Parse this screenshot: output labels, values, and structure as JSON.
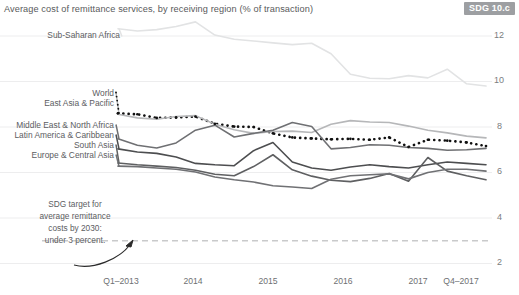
{
  "header": {
    "subtitle": "Average cost of remittance services, by receiving region (% of transaction)",
    "badge": "SDG 10.c"
  },
  "annotation": {
    "line1": "SDG target for",
    "line2": "average remittance",
    "line3": "costs by 2030:",
    "line4": "under 3 percent."
  },
  "series_labels": {
    "sub_saharan_africa": "Sub-Saharan Africa",
    "world": "World",
    "east_asia_pacific": "East Asia & Pacific",
    "middle_east_north_africa": "Middle East & North Africa",
    "latin_america_caribbean": "Latin America & Caribbean",
    "south_asia": "South Asia",
    "europe_central_asia": "Europe & Central Asia"
  },
  "axes": {
    "yticks": [
      "12",
      "10",
      "8",
      "6",
      "4",
      "2"
    ],
    "xticks": [
      "Q1–2013",
      "2014",
      "2015",
      "2016",
      "2017",
      "Q4–2017"
    ]
  },
  "chart_data": {
    "type": "line",
    "title": "Average cost of remittance services, by receiving region (% of transaction)",
    "xlabel": "",
    "ylabel": "% of transaction",
    "ylim": [
      1.4,
      13.0
    ],
    "yticks": [
      2,
      4,
      6,
      8,
      10,
      12
    ],
    "grid": true,
    "legend": "inline-left-labels",
    "x": [
      "Q1-2013",
      "Q2-2013",
      "Q3-2013",
      "Q4-2013",
      "Q1-2014",
      "Q2-2014",
      "Q3-2014",
      "Q4-2014",
      "Q1-2015",
      "Q2-2015",
      "Q3-2015",
      "Q4-2015",
      "Q1-2016",
      "Q2-2016",
      "Q3-2016",
      "Q4-2016",
      "Q1-2017",
      "Q2-2017",
      "Q3-2017",
      "Q4-2017"
    ],
    "xtick_labels": [
      "Q1–2013",
      "2014",
      "2015",
      "2016",
      "2017",
      "Q4–2017"
    ],
    "xtick_positions": [
      0,
      4,
      8,
      12,
      16,
      19
    ],
    "target_line": {
      "label": "SDG target for average remittance costs by 2030: under 3 percent.",
      "value": 3,
      "style": "dashed"
    },
    "series": [
      {
        "name": "Sub-Saharan Africa",
        "color": "#e2e3e4",
        "style": "solid",
        "values": [
          12.32,
          12.22,
          12.28,
          12.42,
          12.62,
          12.04,
          11.86,
          11.78,
          11.7,
          11.62,
          11.68,
          11.22,
          10.32,
          10.14,
          10.12,
          10.26,
          10.16,
          10.54,
          9.9,
          9.8
        ]
      },
      {
        "name": "World",
        "color": "#111111",
        "style": "dotted",
        "values": [
          8.6,
          8.56,
          8.4,
          8.42,
          8.46,
          8.14,
          8.02,
          8.0,
          7.72,
          7.54,
          7.5,
          7.46,
          7.48,
          7.44,
          7.54,
          7.12,
          7.44,
          7.4,
          7.32,
          7.16
        ]
      },
      {
        "name": "East Asia & Pacific",
        "color": "#b6b7b9",
        "style": "solid",
        "values": [
          8.56,
          8.4,
          8.34,
          8.46,
          8.5,
          8.12,
          7.88,
          7.72,
          7.8,
          7.82,
          7.76,
          8.12,
          8.28,
          8.22,
          8.2,
          8.04,
          7.86,
          7.74,
          7.6,
          7.52
        ]
      },
      {
        "name": "Middle East & North Africa",
        "color": "#6f7073",
        "style": "solid",
        "values": [
          7.48,
          7.2,
          7.08,
          7.3,
          7.86,
          8.08,
          7.56,
          7.72,
          7.86,
          8.2,
          8.02,
          7.04,
          7.1,
          7.22,
          7.2,
          7.1,
          7.06,
          6.98,
          7.0,
          7.06
        ]
      },
      {
        "name": "Latin America & Caribbean",
        "color": "#4d4e50",
        "style": "solid",
        "values": [
          7.04,
          6.9,
          6.84,
          6.68,
          6.4,
          6.34,
          6.3,
          6.96,
          7.32,
          6.46,
          6.2,
          6.1,
          6.24,
          6.34,
          6.26,
          6.2,
          6.34,
          6.46,
          6.4,
          6.34
        ]
      },
      {
        "name": "South Asia",
        "color": "#5f6062",
        "style": "solid",
        "values": [
          6.42,
          6.34,
          6.28,
          6.22,
          6.1,
          5.92,
          5.86,
          6.26,
          6.78,
          6.12,
          5.84,
          5.66,
          5.6,
          5.74,
          5.96,
          5.62,
          6.66,
          6.06,
          5.86,
          5.68
        ]
      },
      {
        "name": "Europe & Central Asia",
        "color": "#707174",
        "style": "solid",
        "values": [
          6.28,
          6.26,
          6.2,
          6.14,
          6.02,
          5.8,
          5.68,
          5.58,
          5.42,
          5.36,
          5.3,
          5.7,
          5.86,
          5.9,
          5.94,
          5.72,
          6.0,
          6.14,
          6.14,
          6.06
        ]
      }
    ]
  }
}
